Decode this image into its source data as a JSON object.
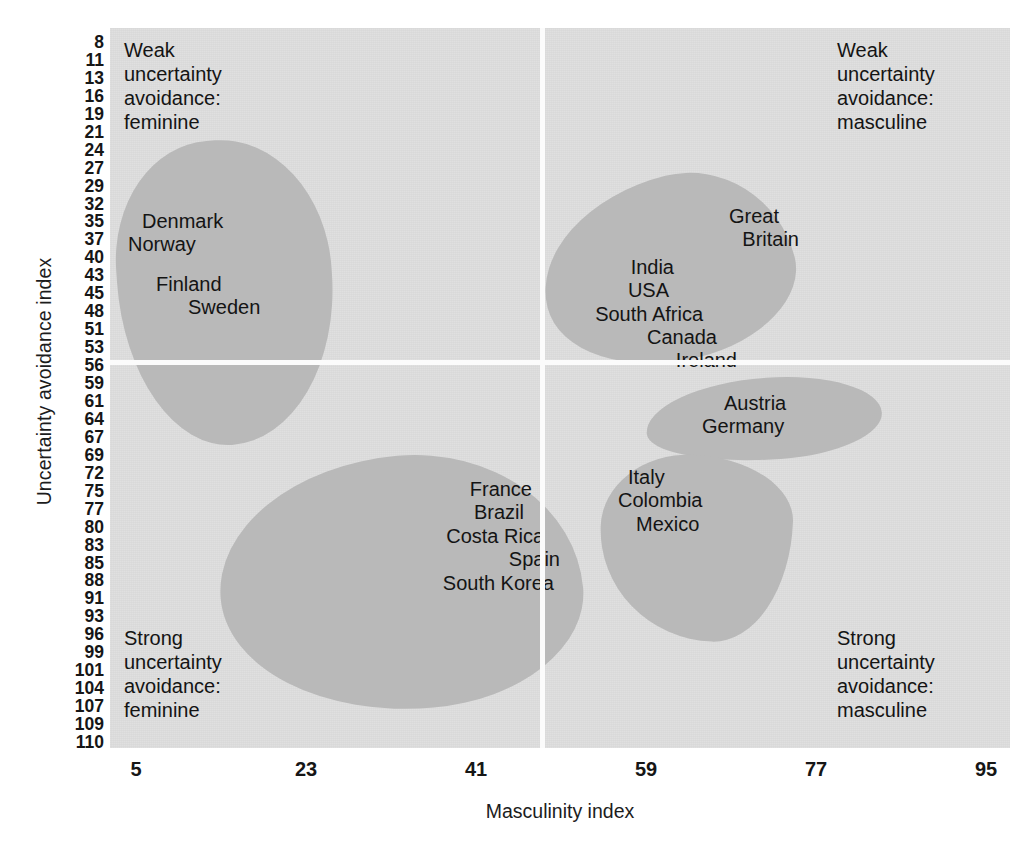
{
  "chart_data": {
    "type": "scatter",
    "title": "",
    "xlabel": "Masculinity index",
    "ylabel": "Uncertainty avoidance index",
    "xticks": [
      "5",
      "23",
      "41",
      "59",
      "77",
      "95"
    ],
    "yticks": [
      "8",
      "11",
      "13",
      "16",
      "19",
      "21",
      "24",
      "27",
      "29",
      "32",
      "35",
      "37",
      "40",
      "43",
      "45",
      "48",
      "51",
      "53",
      "56",
      "59",
      "61",
      "64",
      "67",
      "69",
      "72",
      "75",
      "77",
      "80",
      "83",
      "85",
      "88",
      "91",
      "93",
      "96",
      "99",
      "101",
      "104",
      "107",
      "109",
      "110"
    ],
    "xlim": [
      0,
      100
    ],
    "ylim": [
      8,
      110
    ],
    "grid": false,
    "legend": "none",
    "quadrant_split": {
      "x": 48,
      "y": 55
    },
    "quadrants": [
      {
        "id": "top-left",
        "caption": "Weak\nuncertainty\navoidance:\nfeminine",
        "caption_lines": [
          "Weak",
          "uncertainty",
          "avoidance:",
          "feminine"
        ]
      },
      {
        "id": "top-right",
        "caption": "Weak\nuncertainty\navoidance:\nmasculine",
        "caption_lines": [
          "Weak",
          "uncertainty",
          "avoidance:",
          "masculine"
        ]
      },
      {
        "id": "bottom-left",
        "caption": "Strong\nuncertainty\navoidance:\nfeminine",
        "caption_lines": [
          "Strong",
          "uncertainty",
          "avoidance:",
          "feminine"
        ]
      },
      {
        "id": "bottom-right",
        "caption": "Strong\nuncertainty\navoidance:\nmasculine",
        "caption_lines": [
          "Strong",
          "uncertainty",
          "avoidance:",
          "masculine"
        ]
      }
    ],
    "clusters": [
      {
        "id": "nordic",
        "quadrant": "top-left",
        "countries": [
          "Denmark",
          "Norway",
          "Finland",
          "Sweden"
        ]
      },
      {
        "id": "anglo",
        "quadrant": "top-right",
        "countries": [
          "Great",
          "Britain",
          "India",
          "USA",
          "South Africa",
          "Canada",
          "Ireland"
        ]
      },
      {
        "id": "latin-feminine",
        "quadrant": "bottom-left",
        "countries": [
          "France",
          "Brazil",
          "Costa Rica",
          "Spain",
          "South Korea"
        ]
      },
      {
        "id": "germanic",
        "quadrant": "bottom-right",
        "countries": [
          "Austria",
          "Germany"
        ]
      },
      {
        "id": "latin-masculine",
        "quadrant": "bottom-right",
        "countries": [
          "Italy",
          "Colombia",
          "Mexico"
        ]
      }
    ],
    "colors": {
      "plot_background": "#dddddd",
      "blob_fill": "#b9b9b9",
      "divider": "#fbfbfb",
      "text": "#141414",
      "page_background": "#ffffff"
    }
  },
  "axes": {
    "x": {
      "title": "Masculinity index",
      "ticks": [
        "5",
        "23",
        "41",
        "59",
        "77",
        "95"
      ]
    },
    "y": {
      "title": "Uncertainty avoidance index",
      "ticks": [
        "8",
        "11",
        "13",
        "16",
        "19",
        "21",
        "24",
        "27",
        "29",
        "32",
        "35",
        "37",
        "40",
        "43",
        "45",
        "48",
        "51",
        "53",
        "56",
        "59",
        "61",
        "64",
        "67",
        "69",
        "72",
        "75",
        "77",
        "80",
        "83",
        "85",
        "88",
        "91",
        "93",
        "96",
        "99",
        "101",
        "104",
        "107",
        "109",
        "110"
      ]
    }
  },
  "quadrant_captions": {
    "top_left": {
      "line1": "Weak",
      "line2": "uncertainty",
      "line3": "avoidance:",
      "line4": "feminine"
    },
    "top_right": {
      "line1": "Weak",
      "line2": "uncertainty",
      "line3": "avoidance:",
      "line4": "masculine"
    },
    "bottom_left": {
      "line1": "Strong",
      "line2": "uncertainty",
      "line3": "avoidance:",
      "line4": "feminine"
    },
    "bottom_right": {
      "line1": "Strong",
      "line2": "uncertainty",
      "line3": "avoidance:",
      "line4": "masculine"
    }
  },
  "cluster_labels": {
    "nordic": {
      "c1": "Denmark",
      "c2": "Norway",
      "c3": "Finland",
      "c4": "Sweden"
    },
    "anglo": {
      "c1": "Great",
      "c2": "Britain",
      "c3": "India",
      "c4": "USA",
      "c5": "South Africa",
      "c6": "Canada",
      "c7": "Ireland"
    },
    "latin_feminine": {
      "c1": "France",
      "c2": "Brazil",
      "c3": "Costa Rica",
      "c4": "Spain",
      "c5": "South Korea"
    },
    "germanic": {
      "c1": "Austria",
      "c2": "Germany"
    },
    "latin_masculine": {
      "c1": "Italy",
      "c2": "Colombia",
      "c3": "Mexico"
    }
  }
}
